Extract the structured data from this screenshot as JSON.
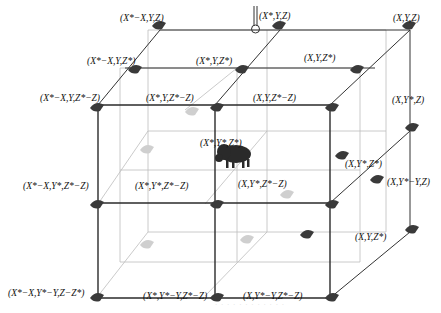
{
  "diagram": {
    "type": "3d-lattice",
    "colors": {
      "front_edge": "#222222",
      "back_edge": "#bbbbbb",
      "diagonal_edge": "#333333",
      "node_dark": "#333333",
      "node_light": "#cccccc",
      "center_animal": "#2a2a2a"
    },
    "top_symbol": "pin-icon",
    "center_node": {
      "label": "(X*,Y*,Z*)",
      "icon": "bison-icon"
    },
    "labels": [
      {
        "id": "xstar-minus-x-y-z",
        "text": "(X*−X,Y,Z)",
        "x": 120,
        "y": 14
      },
      {
        "id": "xstar-y-z",
        "text": "(X*,Y,Z)",
        "x": 259,
        "y": 12
      },
      {
        "id": "x-y-z",
        "text": "(X,Y,Z)",
        "x": 393,
        "y": 14
      },
      {
        "id": "xstar-minus-x-y-zstar",
        "text": "(X*−X,Y,Z*)",
        "x": 87,
        "y": 57
      },
      {
        "id": "xstar-y-zstar",
        "text": "(X*,Y,Z*)",
        "x": 196,
        "y": 57
      },
      {
        "id": "x-y-zstar",
        "text": "(X,Y,Z*)",
        "x": 304,
        "y": 54
      },
      {
        "id": "xstar-minus-x-y-zstar-minus-z",
        "text": "(X*−X,Y,Z*−Z)",
        "x": 40,
        "y": 94
      },
      {
        "id": "xstar-y-zstar-minus-z",
        "text": "(X*,Y,Z*−Z)",
        "x": 146,
        "y": 94
      },
      {
        "id": "x-y-zstar-minus-z",
        "text": "(X,Y,Z*−Z)",
        "x": 253,
        "y": 94
      },
      {
        "id": "x-ystar-z",
        "text": "(X,Y*,Z)",
        "x": 392,
        "y": 96
      },
      {
        "id": "xstar-ystar-zstar",
        "text": "(X*,Y*,Z*)",
        "x": 200,
        "y": 139
      },
      {
        "id": "x-ystar-zstar",
        "text": "(X,Y*,Z*)",
        "x": 345,
        "y": 160
      },
      {
        "id": "xstar-minus-x-ystar-zstar-minus-z",
        "text": "(X*−X,Y*,Z*−Z)",
        "x": 23,
        "y": 182
      },
      {
        "id": "xstar-ystar-zstar-minus-z",
        "text": "(X*,Y*,Z*−Z)",
        "x": 135,
        "y": 182
      },
      {
        "id": "x-ystar-zstar-minus-z",
        "text": "(X,Y*,Z*−Z)",
        "x": 238,
        "y": 180
      },
      {
        "id": "x-ystar-minus-y-z",
        "text": "(X,Y*−Y,Z)",
        "x": 387,
        "y": 178
      },
      {
        "id": "x-y-zstar-2",
        "text": "(X,Y,Z*)",
        "x": 355,
        "y": 233
      },
      {
        "id": "xstar-minus-x-ystar-minus-y-z-minus-zstar",
        "text": "(X*−X,Y*−Y,Z−Z*)",
        "x": 8,
        "y": 289
      },
      {
        "id": "xstar-ystar-minus-y-zstar-minus-z",
        "text": "(X*,Y*−Y,Z*−Z)",
        "x": 143,
        "y": 292
      },
      {
        "id": "x-ystar-minus-y-zstar-minus-z",
        "text": "(X,Y*−Y,Z*−Z)",
        "x": 243,
        "y": 292
      }
    ],
    "caption": "· · · · · · · · · · · ·"
  }
}
